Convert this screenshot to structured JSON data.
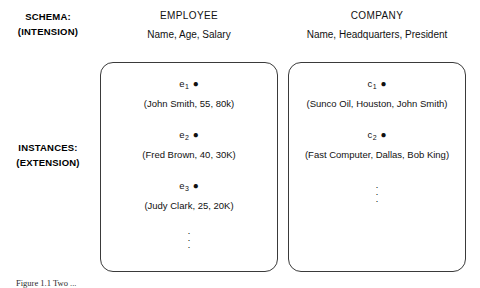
{
  "figure": {
    "background": "#ffffff",
    "stroke_color": "#3a3a3a",
    "text_color": "#111111"
  },
  "row_labels": {
    "schema": {
      "line1": "SCHEMA:",
      "line2": "(INTENSION)"
    },
    "instances": {
      "line1": "INSTANCES:",
      "line2": "(EXTENSION)"
    }
  },
  "columns": [
    {
      "key": "employee",
      "title": "EMPLOYEE",
      "attributes": "Name, Age, Salary",
      "entities": [
        {
          "symbol": "e",
          "subscript": "1",
          "dot": "●",
          "tuple": "(John Smith, 55, 80k)"
        },
        {
          "symbol": "e",
          "subscript": "2",
          "dot": "●",
          "tuple": "(Fred Brown, 40, 30K)"
        },
        {
          "symbol": "e",
          "subscript": "3",
          "dot": "●",
          "tuple": "(Judy Clark, 25, 20K)"
        }
      ],
      "ellipsis": "·"
    },
    {
      "key": "company",
      "title": "COMPANY",
      "attributes": "Name, Headquarters, President",
      "entities": [
        {
          "symbol": "c",
          "subscript": "1",
          "dot": "●",
          "tuple": "(Sunco Oil, Houston, John Smith)"
        },
        {
          "symbol": "c",
          "subscript": "2",
          "dot": "●",
          "tuple": "(Fast Computer, Dallas, Bob King)"
        }
      ],
      "ellipsis": "·"
    }
  ],
  "caption": "Figure 1.1  Two ..."
}
